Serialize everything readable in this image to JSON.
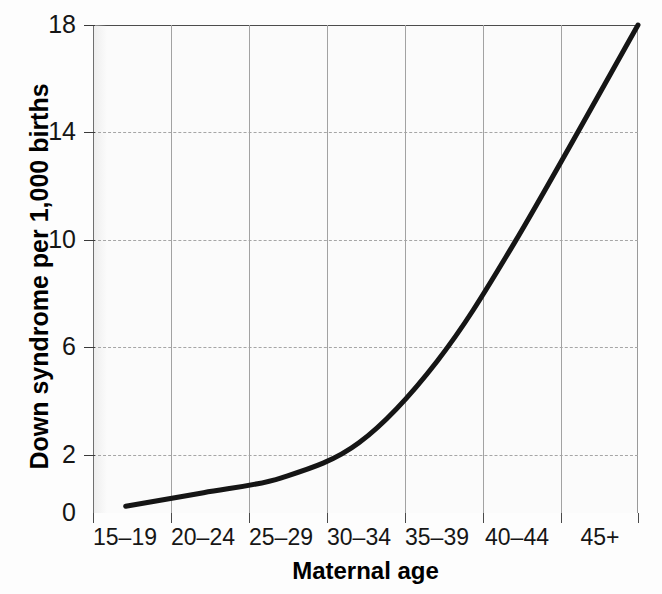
{
  "chart_data": {
    "type": "line",
    "title": "",
    "xlabel": "Maternal age",
    "ylabel": "Down syndrome per 1,000 births",
    "categories": [
      "15–19",
      "20–24",
      "25–29",
      "30–34",
      "35–39",
      "40–44",
      "45+"
    ],
    "yticks": [
      "0",
      "2",
      "6",
      "10",
      "14",
      "18"
    ],
    "ytick_values": [
      0,
      2,
      6,
      10,
      14,
      18
    ],
    "ylim": [
      0,
      18
    ],
    "grid": "both",
    "legend": "none",
    "series": [
      {
        "name": "Down syndrome rate",
        "values": [
          0.25,
          0.8,
          1.3,
          2.6,
          5.5,
          10.0,
          18.0
        ],
        "curve_points": [
          {
            "x": "15–19",
            "y": 0.25
          },
          {
            "x": "20–24",
            "y": 0.75
          },
          {
            "x": "25–29",
            "y": 1.3
          },
          {
            "x": "30–34",
            "y": 2.6
          },
          {
            "x": "35–39",
            "y": 5.6
          },
          {
            "x": "40–44",
            "y": 10.0
          },
          {
            "x": "45+",
            "y": 18.0
          }
        ],
        "color": "#151515",
        "line_width": 5
      }
    ]
  },
  "axes": {
    "y_title": "Down syndrome per 1,000 births",
    "x_title": "Maternal age",
    "y_ticks": [
      "18",
      "14",
      "10",
      "6",
      "2",
      "0"
    ],
    "x_ticks": [
      "15–19",
      "20–24",
      "25–29",
      "30–34",
      "35–39",
      "40–44",
      "45+"
    ]
  },
  "colors": {
    "curve": "#151515",
    "grid": "#a6a6a6",
    "axis": "#4d4d4d",
    "text": "#161616",
    "plot_background": "#fbfbfb",
    "page_background": "#fdfdfd"
  },
  "bleed_text": {
    "line1": "erent between the Utah Mormons and the",
    "line2": "milies with children who have cystic fibro-",
    "line3": "me. Interviews took place around 1988 and",
    "line4": "3 to 5."
  }
}
